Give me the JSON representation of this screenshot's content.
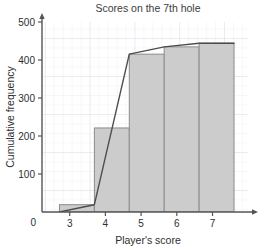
{
  "chart_data": {
    "type": "bar",
    "title": "Scores on the 7th hole",
    "xlabel": "Player's score",
    "ylabel": "Cumulative frequency",
    "categories": [
      "2.5-3.5",
      "3.5-4.5",
      "4.5-5.5",
      "5.5-6.5",
      "6.5-7.5"
    ],
    "bin_edges": [
      2.5,
      3.5,
      4.5,
      5.5,
      6.5,
      7.5
    ],
    "values": [
      20,
      230,
      432,
      452,
      462
    ],
    "xlim": [
      2.0,
      7.9
    ],
    "ylim": [
      0,
      520
    ],
    "x_ticks": [
      3,
      4,
      5,
      6,
      7
    ],
    "x_tick_labels": [
      "3",
      "4",
      "5",
      "6",
      "7"
    ],
    "y_ticks": [
      0,
      100,
      200,
      300,
      400,
      500
    ],
    "y_tick_labels": [
      "0",
      "100",
      "200",
      "300",
      "400",
      "500"
    ],
    "origin_label": "0",
    "grid": true,
    "legend": "none",
    "series": [
      {
        "name": "Cumulative frequency",
        "type": "line",
        "x": [
          2.5,
          3.5,
          4.5,
          5.5,
          6.5,
          7.5
        ],
        "values": [
          0,
          20,
          432,
          452,
          462,
          462
        ]
      }
    ],
    "colors": {
      "bar_fill": "#cccccc",
      "bar_stroke": "#8c8c8c",
      "line": "#4d4d4d",
      "grid_major": "#d8dde6",
      "grid_minor": "#eceef2",
      "axis": "#555555",
      "text": "#2e2e2e"
    }
  }
}
